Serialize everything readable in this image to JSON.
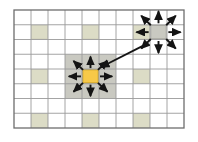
{
  "figure": {
    "background_color": "#ffffff",
    "caption": ""
  },
  "grid": {
    "columns": 10,
    "rows": 8,
    "origin_x": 14,
    "origin_y": 10,
    "cell_width": 17.0,
    "cell_height": 14.75,
    "line_color": "#9a9a9a",
    "line_width": 0.9,
    "outer_border_color": "#6d6d6d",
    "outer_border_width": 1.3,
    "cell_fill": "#ffffff"
  },
  "chart_data": {
    "type": "diagram",
    "grid_size": [
      10,
      8
    ],
    "layers": [
      "grid",
      "pattern-cells",
      "halo-block",
      "active-cell",
      "arrows"
    ],
    "legend": []
  },
  "pattern_cells": {
    "label": "Pale shaded sample cells",
    "fill": "#dcdcc6",
    "stroke": "#c6c6b0",
    "cells": [
      {
        "col": 1,
        "row": 1
      },
      {
        "col": 4,
        "row": 1
      },
      {
        "col": 7,
        "row": 1
      },
      {
        "col": 1,
        "row": 4
      },
      {
        "col": 4,
        "row": 4
      },
      {
        "col": 7,
        "row": 4
      },
      {
        "col": 1,
        "row": 7
      },
      {
        "col": 4,
        "row": 7
      },
      {
        "col": 7,
        "row": 7
      }
    ]
  },
  "halo_block": {
    "label": "Grey neighborhood block around active cell",
    "fill": "#c9c9c1",
    "col": 3,
    "row": 3,
    "span_cols": 3,
    "span_rows": 3
  },
  "active_cell": {
    "label": "Active centre cell",
    "fill": "#f7c948",
    "stroke": "#b98f14",
    "col": 4,
    "row": 4
  },
  "secondary_cell": {
    "label": "Secondary expanded cell",
    "fill": "#c9c9c1",
    "stroke": "#9d9d95",
    "col": 8,
    "row": 1
  },
  "arrows": {
    "color": "#141414",
    "stroke_width": 1.9,
    "head_length": 5.2,
    "head_width": 4.4,
    "center_cluster": {
      "label": "Eight-direction expansion from centre cell",
      "count": 8,
      "directions": [
        "N",
        "NE",
        "E",
        "SE",
        "S",
        "SW",
        "W",
        "NW"
      ]
    },
    "secondary_cluster": {
      "label": "Eight-direction expansion from secondary cell",
      "count": 8,
      "directions": [
        "N",
        "NE",
        "E",
        "SE",
        "S",
        "SW",
        "W",
        "NW"
      ]
    },
    "link_arrow": {
      "label": "Diagonal link from centre cluster to secondary cell",
      "from": "center",
      "to": "secondary"
    }
  }
}
